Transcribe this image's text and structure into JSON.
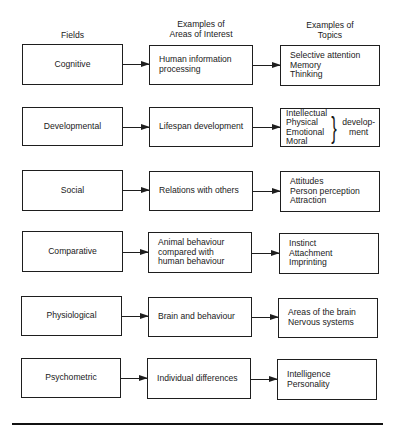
{
  "diagram": {
    "headers": {
      "fields": "Fields",
      "areas": [
        "Examples of",
        "Areas of Interest"
      ],
      "topics": [
        "Examples of",
        "Topics"
      ]
    },
    "rows": [
      {
        "field": "Cognitive",
        "area": [
          "Human information",
          "processing"
        ],
        "topics": [
          "Selective attention",
          "Memory",
          "Thinking"
        ]
      },
      {
        "field": "Developmental",
        "area": [
          "Lifespan development"
        ],
        "topics": [
          "Intellectual",
          "Physical",
          "Emotional",
          "Moral"
        ],
        "topics_brace_suffix": [
          "develop-",
          "ment"
        ]
      },
      {
        "field": "Social",
        "area": [
          "Relations with others"
        ],
        "topics": [
          "Attitudes",
          "Person perception",
          "Attraction"
        ]
      },
      {
        "field": "Comparative",
        "area": [
          "Animal behaviour",
          "compared with",
          "human behaviour"
        ],
        "topics": [
          "Instinct",
          "Attachment",
          "Imprinting"
        ]
      },
      {
        "field": "Physiological",
        "area": [
          "Brain and behaviour"
        ],
        "topics": [
          "Areas of the brain",
          "Nervous systems"
        ]
      },
      {
        "field": "Psychometric",
        "area": [
          "Individual differences"
        ],
        "topics": [
          "Intelligence",
          "Personality"
        ]
      }
    ],
    "brace_glyph": "}"
  }
}
